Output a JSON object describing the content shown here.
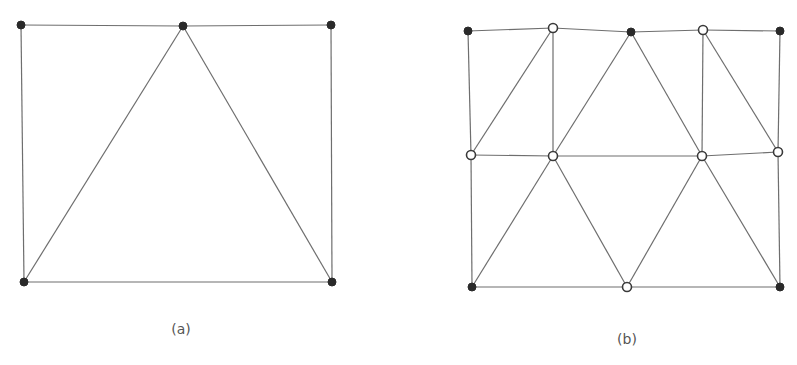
{
  "figures": [
    {
      "id": "a",
      "caption": "(a)",
      "caption_pos": [
        181,
        321
      ],
      "nodes": [
        {
          "x": 21,
          "y": 25,
          "type": "filled"
        },
        {
          "x": 183,
          "y": 26,
          "type": "filled"
        },
        {
          "x": 331,
          "y": 25,
          "type": "filled"
        },
        {
          "x": 24,
          "y": 282,
          "type": "filled"
        },
        {
          "x": 332,
          "y": 282,
          "type": "filled"
        }
      ],
      "edges": [
        [
          0,
          1
        ],
        [
          1,
          2
        ],
        [
          0,
          3
        ],
        [
          2,
          4
        ],
        [
          3,
          4
        ],
        [
          1,
          3
        ],
        [
          1,
          4
        ]
      ]
    },
    {
      "id": "b",
      "caption": "(b)",
      "caption_pos": [
        627,
        331
      ],
      "nodes": [
        {
          "x": 468,
          "y": 31,
          "type": "filled"
        },
        {
          "x": 553,
          "y": 28,
          "type": "open"
        },
        {
          "x": 631,
          "y": 32,
          "type": "filled"
        },
        {
          "x": 703,
          "y": 30,
          "type": "open"
        },
        {
          "x": 780,
          "y": 31,
          "type": "filled"
        },
        {
          "x": 471,
          "y": 155,
          "type": "open"
        },
        {
          "x": 553,
          "y": 156,
          "type": "open"
        },
        {
          "x": 702,
          "y": 156,
          "type": "open"
        },
        {
          "x": 778,
          "y": 152,
          "type": "open"
        },
        {
          "x": 472,
          "y": 287,
          "type": "filled"
        },
        {
          "x": 627,
          "y": 287,
          "type": "open"
        },
        {
          "x": 780,
          "y": 287,
          "type": "filled"
        }
      ],
      "edges": [
        [
          0,
          1
        ],
        [
          1,
          2
        ],
        [
          2,
          3
        ],
        [
          3,
          4
        ],
        [
          0,
          5
        ],
        [
          5,
          9
        ],
        [
          4,
          8
        ],
        [
          8,
          11
        ],
        [
          1,
          5
        ],
        [
          1,
          6
        ],
        [
          2,
          6
        ],
        [
          2,
          7
        ],
        [
          3,
          7
        ],
        [
          3,
          8
        ],
        [
          5,
          6
        ],
        [
          6,
          7
        ],
        [
          7,
          8
        ],
        [
          6,
          9
        ],
        [
          6,
          10
        ],
        [
          7,
          10
        ],
        [
          7,
          11
        ],
        [
          9,
          10
        ],
        [
          10,
          11
        ]
      ]
    }
  ],
  "colors": {
    "edge": "#6e6e6e",
    "filled_node": "#2a2a2a",
    "open_node_stroke": "#3a3a3a",
    "caption": "#555555"
  }
}
